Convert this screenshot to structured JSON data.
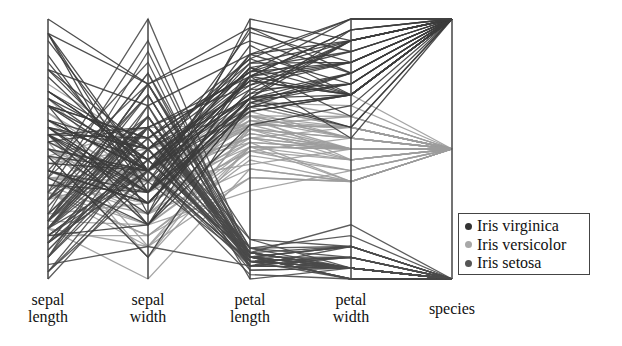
{
  "chart_data": {
    "type": "parallel_coordinates",
    "title": "",
    "axes": [
      {
        "key": "sepal_length",
        "label": [
          "sepal",
          "length"
        ],
        "range": [
          4.3,
          7.9
        ]
      },
      {
        "key": "sepal_width",
        "label": [
          "sepal",
          "width"
        ],
        "range": [
          2.0,
          4.4
        ]
      },
      {
        "key": "petal_length",
        "label": [
          "petal",
          "length"
        ],
        "range": [
          1.0,
          6.9
        ]
      },
      {
        "key": "petal_width",
        "label": [
          "petal",
          "width"
        ],
        "range": [
          0.1,
          2.5
        ]
      },
      {
        "key": "species",
        "label": [
          "species"
        ],
        "range": [
          0,
          2
        ]
      }
    ],
    "legend": [
      {
        "name": "Iris virginica",
        "color": "#3a3a3a",
        "species_pos": 2
      },
      {
        "name": "Iris versicolor",
        "color": "#9a9a9a",
        "species_pos": 1
      },
      {
        "name": "Iris setosa",
        "color": "#4a4a4a",
        "species_pos": 0
      }
    ],
    "legend_position": "lower right",
    "grid": false,
    "series": [
      {
        "name": "Iris setosa",
        "rows": [
          [
            5.1,
            3.5,
            1.4,
            0.2
          ],
          [
            4.9,
            3.0,
            1.4,
            0.2
          ],
          [
            4.7,
            3.2,
            1.3,
            0.2
          ],
          [
            4.6,
            3.1,
            1.5,
            0.2
          ],
          [
            5.0,
            3.6,
            1.4,
            0.2
          ],
          [
            5.4,
            3.9,
            1.7,
            0.4
          ],
          [
            4.6,
            3.4,
            1.4,
            0.3
          ],
          [
            5.0,
            3.4,
            1.5,
            0.2
          ],
          [
            4.4,
            2.9,
            1.4,
            0.2
          ],
          [
            4.9,
            3.1,
            1.5,
            0.1
          ],
          [
            5.4,
            3.7,
            1.5,
            0.2
          ],
          [
            4.8,
            3.4,
            1.6,
            0.2
          ],
          [
            4.8,
            3.0,
            1.4,
            0.1
          ],
          [
            4.3,
            3.0,
            1.1,
            0.1
          ],
          [
            5.8,
            4.0,
            1.2,
            0.2
          ],
          [
            5.7,
            4.4,
            1.5,
            0.4
          ],
          [
            5.4,
            3.9,
            1.3,
            0.4
          ],
          [
            5.1,
            3.5,
            1.4,
            0.3
          ],
          [
            5.7,
            3.8,
            1.7,
            0.3
          ],
          [
            5.1,
            3.8,
            1.5,
            0.3
          ],
          [
            5.4,
            3.4,
            1.7,
            0.2
          ],
          [
            5.1,
            3.7,
            1.5,
            0.4
          ],
          [
            4.6,
            3.6,
            1.0,
            0.2
          ],
          [
            5.1,
            3.3,
            1.7,
            0.5
          ],
          [
            4.8,
            3.4,
            1.9,
            0.2
          ],
          [
            5.0,
            3.0,
            1.6,
            0.2
          ],
          [
            5.0,
            3.4,
            1.6,
            0.4
          ],
          [
            5.2,
            3.5,
            1.5,
            0.2
          ],
          [
            5.2,
            3.4,
            1.4,
            0.2
          ],
          [
            4.7,
            3.2,
            1.6,
            0.2
          ],
          [
            4.8,
            3.1,
            1.6,
            0.2
          ],
          [
            5.4,
            3.4,
            1.5,
            0.4
          ],
          [
            5.2,
            4.1,
            1.5,
            0.1
          ],
          [
            5.5,
            4.2,
            1.4,
            0.2
          ],
          [
            4.9,
            3.1,
            1.5,
            0.1
          ],
          [
            5.0,
            3.2,
            1.2,
            0.2
          ],
          [
            5.5,
            3.5,
            1.3,
            0.2
          ],
          [
            4.9,
            3.1,
            1.5,
            0.1
          ],
          [
            4.4,
            3.0,
            1.3,
            0.2
          ],
          [
            5.1,
            3.4,
            1.5,
            0.2
          ],
          [
            5.0,
            3.5,
            1.3,
            0.3
          ],
          [
            4.5,
            2.3,
            1.3,
            0.3
          ],
          [
            4.4,
            3.2,
            1.3,
            0.2
          ],
          [
            5.0,
            3.5,
            1.6,
            0.6
          ],
          [
            5.1,
            3.8,
            1.9,
            0.4
          ],
          [
            4.8,
            3.0,
            1.4,
            0.3
          ],
          [
            5.1,
            3.8,
            1.6,
            0.2
          ],
          [
            4.6,
            3.2,
            1.4,
            0.2
          ],
          [
            5.3,
            3.7,
            1.5,
            0.2
          ],
          [
            5.0,
            3.3,
            1.4,
            0.2
          ]
        ]
      },
      {
        "name": "Iris versicolor",
        "rows": [
          [
            7.0,
            3.2,
            4.7,
            1.4
          ],
          [
            6.4,
            3.2,
            4.5,
            1.5
          ],
          [
            6.9,
            3.1,
            4.9,
            1.5
          ],
          [
            5.5,
            2.3,
            4.0,
            1.3
          ],
          [
            6.5,
            2.8,
            4.6,
            1.5
          ],
          [
            5.7,
            2.8,
            4.5,
            1.3
          ],
          [
            6.3,
            3.3,
            4.7,
            1.6
          ],
          [
            4.9,
            2.4,
            3.3,
            1.0
          ],
          [
            6.6,
            2.9,
            4.6,
            1.3
          ],
          [
            5.2,
            2.7,
            3.9,
            1.4
          ],
          [
            5.0,
            2.0,
            3.5,
            1.0
          ],
          [
            5.9,
            3.0,
            4.2,
            1.5
          ],
          [
            6.0,
            2.2,
            4.0,
            1.0
          ],
          [
            6.1,
            2.9,
            4.7,
            1.4
          ],
          [
            5.6,
            2.9,
            3.6,
            1.3
          ],
          [
            6.7,
            3.1,
            4.4,
            1.4
          ],
          [
            5.6,
            3.0,
            4.5,
            1.5
          ],
          [
            5.8,
            2.7,
            4.1,
            1.0
          ],
          [
            6.2,
            2.2,
            4.5,
            1.5
          ],
          [
            5.6,
            2.5,
            3.9,
            1.1
          ],
          [
            5.9,
            3.2,
            4.8,
            1.8
          ],
          [
            6.1,
            2.8,
            4.0,
            1.3
          ],
          [
            6.3,
            2.5,
            4.9,
            1.5
          ],
          [
            6.1,
            2.8,
            4.7,
            1.2
          ],
          [
            6.4,
            2.9,
            4.3,
            1.3
          ],
          [
            6.6,
            3.0,
            4.4,
            1.4
          ],
          [
            6.8,
            2.8,
            4.8,
            1.4
          ],
          [
            6.7,
            3.0,
            5.0,
            1.7
          ],
          [
            6.0,
            2.9,
            4.5,
            1.5
          ],
          [
            5.7,
            2.6,
            3.5,
            1.0
          ],
          [
            5.5,
            2.4,
            3.8,
            1.1
          ],
          [
            5.5,
            2.4,
            3.7,
            1.0
          ],
          [
            5.8,
            2.7,
            3.9,
            1.2
          ],
          [
            6.0,
            2.7,
            5.1,
            1.6
          ],
          [
            5.4,
            3.0,
            4.5,
            1.5
          ],
          [
            6.0,
            3.4,
            4.5,
            1.6
          ],
          [
            6.7,
            3.1,
            4.7,
            1.5
          ],
          [
            6.3,
            2.3,
            4.4,
            1.3
          ],
          [
            5.6,
            3.0,
            4.1,
            1.3
          ],
          [
            5.5,
            2.5,
            4.0,
            1.3
          ],
          [
            5.5,
            2.6,
            4.4,
            1.2
          ],
          [
            6.1,
            3.0,
            4.6,
            1.4
          ],
          [
            5.8,
            2.6,
            4.0,
            1.2
          ],
          [
            5.0,
            2.3,
            3.3,
            1.0
          ],
          [
            5.6,
            2.7,
            4.2,
            1.3
          ],
          [
            5.7,
            3.0,
            4.2,
            1.2
          ],
          [
            5.7,
            2.9,
            4.2,
            1.3
          ],
          [
            6.2,
            2.9,
            4.3,
            1.3
          ],
          [
            5.1,
            2.5,
            3.0,
            1.1
          ],
          [
            5.7,
            2.8,
            4.1,
            1.3
          ]
        ]
      },
      {
        "name": "Iris virginica",
        "rows": [
          [
            6.3,
            3.3,
            6.0,
            2.5
          ],
          [
            5.8,
            2.7,
            5.1,
            1.9
          ],
          [
            7.1,
            3.0,
            5.9,
            2.1
          ],
          [
            6.3,
            2.9,
            5.6,
            1.8
          ],
          [
            6.5,
            3.0,
            5.8,
            2.2
          ],
          [
            7.6,
            3.0,
            6.6,
            2.1
          ],
          [
            4.9,
            2.5,
            4.5,
            1.7
          ],
          [
            7.3,
            2.9,
            6.3,
            1.8
          ],
          [
            6.7,
            2.5,
            5.8,
            1.8
          ],
          [
            7.2,
            3.6,
            6.1,
            2.5
          ],
          [
            6.5,
            3.2,
            5.1,
            2.0
          ],
          [
            6.4,
            2.7,
            5.3,
            1.9
          ],
          [
            6.8,
            3.0,
            5.5,
            2.1
          ],
          [
            5.7,
            2.5,
            5.0,
            2.0
          ],
          [
            5.8,
            2.8,
            5.1,
            2.4
          ],
          [
            6.4,
            3.2,
            5.3,
            2.3
          ],
          [
            6.5,
            3.0,
            5.5,
            1.8
          ],
          [
            7.7,
            3.8,
            6.7,
            2.2
          ],
          [
            7.7,
            2.6,
            6.9,
            2.3
          ],
          [
            6.0,
            2.2,
            5.0,
            1.5
          ],
          [
            6.9,
            3.2,
            5.7,
            2.3
          ],
          [
            5.6,
            2.8,
            4.9,
            2.0
          ],
          [
            7.7,
            2.8,
            6.7,
            2.0
          ],
          [
            6.3,
            2.7,
            4.9,
            1.8
          ],
          [
            6.7,
            3.3,
            5.7,
            2.1
          ],
          [
            7.2,
            3.2,
            6.0,
            1.8
          ],
          [
            6.2,
            2.8,
            4.8,
            1.8
          ],
          [
            6.1,
            3.0,
            4.9,
            1.8
          ],
          [
            6.4,
            2.8,
            5.6,
            2.1
          ],
          [
            7.2,
            3.0,
            5.8,
            1.6
          ],
          [
            7.4,
            2.8,
            6.1,
            1.9
          ],
          [
            7.9,
            3.8,
            6.4,
            2.0
          ],
          [
            6.4,
            2.8,
            5.6,
            2.2
          ],
          [
            6.3,
            2.8,
            5.1,
            1.5
          ],
          [
            6.1,
            2.6,
            5.6,
            1.4
          ],
          [
            7.7,
            3.0,
            6.1,
            2.3
          ],
          [
            6.3,
            3.4,
            5.6,
            2.4
          ],
          [
            6.4,
            3.1,
            5.5,
            1.8
          ],
          [
            6.0,
            3.0,
            4.8,
            1.8
          ],
          [
            6.9,
            3.1,
            5.4,
            2.1
          ],
          [
            6.7,
            3.1,
            5.6,
            2.4
          ],
          [
            6.9,
            3.1,
            5.1,
            2.3
          ],
          [
            5.8,
            2.7,
            5.1,
            1.9
          ],
          [
            6.8,
            3.2,
            5.9,
            2.3
          ],
          [
            6.7,
            3.3,
            5.7,
            2.5
          ],
          [
            6.7,
            3.0,
            5.2,
            2.3
          ],
          [
            6.3,
            2.5,
            5.0,
            1.9
          ],
          [
            6.5,
            3.0,
            5.2,
            2.0
          ],
          [
            6.2,
            3.4,
            5.4,
            2.3
          ],
          [
            5.9,
            3.0,
            5.1,
            1.8
          ]
        ]
      }
    ]
  },
  "layout": {
    "axis_x": [
      48,
      148,
      250,
      351,
      452
    ],
    "top_y": 19,
    "bottom_y": 279,
    "axis_label_top": [
      291,
      291,
      291,
      291,
      300
    ]
  }
}
